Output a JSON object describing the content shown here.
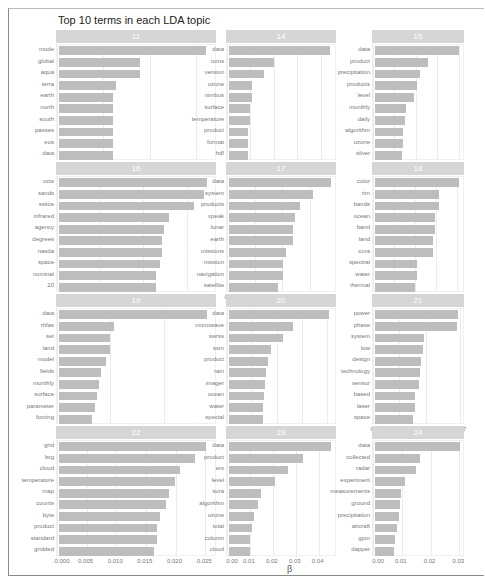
{
  "chart_data": {
    "type": "bar",
    "orientation": "horizontal",
    "title": "Top 10 terms in each LDA topic",
    "xlabel": "β",
    "ylabel": "",
    "facets": [
      {
        "topic": "11",
        "terms": [
          "mode",
          "global",
          "aqua",
          "terra",
          "earth",
          "north",
          "south",
          "passes",
          "eos",
          "data"
        ],
        "values": [
          0.065,
          0.036,
          0.036,
          0.025,
          0.024,
          0.024,
          0.024,
          0.024,
          0.024,
          0.024
        ],
        "xlim": [
          0,
          0.069
        ],
        "ticks": [
          "0.00",
          "0.02",
          "0.04",
          "0.06"
        ],
        "tick_vals": [
          0,
          0.02,
          0.04,
          0.06
        ]
      },
      {
        "topic": "14",
        "terms": [
          "data",
          "toms",
          "version",
          "ozone",
          "nimbus",
          "surface",
          "temperature",
          "product",
          "format",
          "hdf"
        ],
        "values": [
          0.045,
          0.02,
          0.0155,
          0.01,
          0.01,
          0.0095,
          0.0095,
          0.0085,
          0.0085,
          0.0085
        ],
        "xlim": [
          0,
          0.047
        ],
        "ticks": [
          "0.00",
          "0.01",
          "0.02",
          "0.03",
          "0.04"
        ],
        "tick_vals": [
          0,
          0.01,
          0.02,
          0.03,
          0.04
        ]
      },
      {
        "topic": "15",
        "terms": [
          "data",
          "product",
          "precipitation",
          "products",
          "level",
          "monthly",
          "daily",
          "algorithm",
          "ozone",
          "silver"
        ],
        "values": [
          0.041,
          0.026,
          0.022,
          0.0205,
          0.019,
          0.015,
          0.0145,
          0.0135,
          0.0135,
          0.013
        ],
        "xlim": [
          0,
          0.043
        ],
        "ticks": [
          "0.00",
          "0.01",
          "0.02",
          "0.03",
          "0.04"
        ],
        "tick_vals": [
          0,
          0.01,
          0.02,
          0.03,
          0.04
        ]
      },
      {
        "topic": "16",
        "terms": [
          "octs",
          "sands",
          "sstice",
          "infrared",
          "agency",
          "degrees",
          "nasda",
          "space",
          "nominal",
          "20"
        ],
        "values": [
          0.035,
          0.0345,
          0.032,
          0.026,
          0.025,
          0.0245,
          0.0245,
          0.024,
          0.023,
          0.023
        ],
        "xlim": [
          0,
          0.037
        ],
        "ticks": [
          "0.00",
          "0.01",
          "0.02",
          "0.03"
        ],
        "tick_vals": [
          0,
          0.01,
          0.02,
          0.03
        ]
      },
      {
        "topic": "17",
        "terms": [
          "data",
          "system",
          "products",
          "xpeak",
          "lunar",
          "earth",
          "missions",
          "mission",
          "navigation",
          "satellite"
        ],
        "values": [
          0.0115,
          0.0095,
          0.008,
          0.0075,
          0.0072,
          0.0072,
          0.0065,
          0.0061,
          0.0061,
          0.0055
        ],
        "xlim": [
          0,
          0.012
        ],
        "ticks": [
          "0.000",
          "0.003",
          "0.006",
          "0.009"
        ],
        "tick_vals": [
          0,
          0.003,
          0.006,
          0.009
        ]
      },
      {
        "topic": "18",
        "terms": [
          "color",
          "rim",
          "bands",
          "ocean",
          "band",
          "land",
          "cora",
          "spectral",
          "water",
          "thermal"
        ],
        "values": [
          0.042,
          0.032,
          0.032,
          0.03,
          0.03,
          0.029,
          0.029,
          0.021,
          0.021,
          0.02
        ],
        "xlim": [
          0,
          0.044
        ],
        "ticks": [
          "0.00",
          "0.01",
          "0.02",
          "0.03",
          "0.04"
        ],
        "tick_vals": [
          0,
          0.01,
          0.02,
          0.03,
          0.04
        ]
      },
      {
        "topic": "19",
        "terms": [
          "data",
          "rhfas",
          "set",
          "land",
          "model",
          "fields",
          "monthly",
          "surface",
          "parameter",
          "forcing"
        ],
        "values": [
          0.057,
          0.021,
          0.0195,
          0.0195,
          0.018,
          0.016,
          0.0155,
          0.0145,
          0.014,
          0.0125
        ],
        "xlim": [
          0,
          0.06
        ],
        "ticks": [
          "0.00",
          "0.02",
          "0.04"
        ],
        "tick_vals": [
          0,
          0.02,
          0.04
        ]
      },
      {
        "topic": "20",
        "terms": [
          "data",
          "microwave",
          "swrss",
          "ssm",
          "product",
          "rain",
          "imager",
          "ocean",
          "water",
          "special"
        ],
        "values": [
          0.0415,
          0.0265,
          0.0225,
          0.0175,
          0.016,
          0.0155,
          0.015,
          0.0145,
          0.014,
          0.014
        ],
        "xlim": [
          0,
          0.044
        ],
        "ticks": [
          "0.00",
          "0.01",
          "0.02",
          "0.03",
          "0.04"
        ],
        "tick_vals": [
          0,
          0.01,
          0.02,
          0.03,
          0.04
        ]
      },
      {
        "topic": "21",
        "terms": [
          "power",
          "phase",
          "system",
          "low",
          "design",
          "technology",
          "sensor",
          "based",
          "laser",
          "space"
        ],
        "values": [
          0.0165,
          0.0163,
          0.0098,
          0.0095,
          0.0091,
          0.009,
          0.0087,
          0.008,
          0.0079,
          0.0076
        ],
        "xlim": [
          0,
          0.0175
        ],
        "ticks": [
          "0.000",
          "0.005",
          "0.010",
          "0.017"
        ],
        "tick_vals": [
          0,
          0.005,
          0.01,
          0.0165
        ]
      },
      {
        "topic": "22",
        "terms": [
          "grid",
          "lstg",
          "cloud",
          "temperature",
          "map",
          "counts",
          "byte",
          "product",
          "standard",
          "gridded"
        ],
        "values": [
          0.0255,
          0.0235,
          0.021,
          0.02,
          0.019,
          0.0185,
          0.0175,
          0.017,
          0.017,
          0.0165
        ],
        "xlim": [
          0,
          0.027
        ],
        "ticks": [
          "0.000",
          "0.005",
          "0.010",
          "0.015",
          "0.020",
          "0.025"
        ],
        "tick_vals": [
          0,
          0.005,
          0.01,
          0.015,
          0.02,
          0.025
        ]
      },
      {
        "topic": "23",
        "terms": [
          "data",
          "product",
          "ers",
          "level",
          "sura",
          "algorithm",
          "ozone",
          "total",
          "column",
          "cloud"
        ],
        "values": [
          0.046,
          0.0335,
          0.0265,
          0.021,
          0.0145,
          0.013,
          0.0115,
          0.0105,
          0.0095,
          0.0095
        ],
        "xlim": [
          0,
          0.048
        ],
        "ticks": [
          "0.00",
          "0.01",
          "0.02",
          "0.03",
          "0.04"
        ],
        "tick_vals": [
          0,
          0.01,
          0.02,
          0.03,
          0.04
        ]
      },
      {
        "topic": "24",
        "terms": [
          "data",
          "collected",
          "radar",
          "experiment",
          "measurements",
          "ground",
          "precipitation",
          "aircraft",
          "gpm",
          "dapper"
        ],
        "values": [
          0.031,
          0.0165,
          0.0148,
          0.0108,
          0.0093,
          0.0092,
          0.0088,
          0.0079,
          0.0073,
          0.0068
        ],
        "xlim": [
          0,
          0.032
        ],
        "ticks": [
          "0.00",
          "0.01",
          "0.02",
          "0.03"
        ],
        "tick_vals": [
          0,
          0.01,
          0.02,
          0.03
        ]
      }
    ],
    "grid": true,
    "legend": "none",
    "bar_color": "#bdbdbd"
  }
}
